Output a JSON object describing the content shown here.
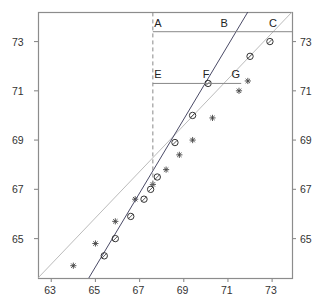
{
  "chart_data": {
    "type": "scatter",
    "title": "",
    "xlabel": "",
    "ylabel": "",
    "xlim": [
      62.4,
      73.9
    ],
    "ylim": [
      63.4,
      74.2
    ],
    "grid": false,
    "legend": null,
    "xticks": [
      63,
      65,
      67,
      69,
      71,
      73
    ],
    "yticks_left": [
      65,
      67,
      69,
      71,
      73
    ],
    "yticks_right": [
      65,
      67,
      69,
      71,
      73
    ],
    "xtick_labels": [
      "63",
      "65",
      "67",
      "69",
      "71",
      "73"
    ],
    "ytick_labels_left": [
      "65",
      "67",
      "69",
      "71",
      "73"
    ],
    "ytick_labels_right": [
      "65",
      "67",
      "69",
      "71",
      "73"
    ],
    "series": [
      {
        "name": "reference-line-stars",
        "marker": "star",
        "color": "#b3b3b3",
        "marker_color": "#444444",
        "line_from": [
          62.4,
          63.4
        ],
        "line_to": [
          73.9,
          74.2
        ],
        "points": [
          [
            64.0,
            63.9
          ],
          [
            65.0,
            64.8
          ],
          [
            65.9,
            65.7
          ],
          [
            66.8,
            66.6
          ],
          [
            67.6,
            67.2
          ],
          [
            68.2,
            67.8
          ],
          [
            68.8,
            68.4
          ],
          [
            69.4,
            69.0
          ],
          [
            70.3,
            69.9
          ],
          [
            71.5,
            71.0
          ],
          [
            71.9,
            71.4
          ]
        ]
      },
      {
        "name": "sample-line-circles",
        "marker": "circle",
        "color": "#4a4a66",
        "marker_color": "#333333",
        "line_from": [
          64.7,
          63.4
        ],
        "line_to": [
          71.9,
          74.2
        ],
        "points": [
          [
            65.4,
            64.3
          ],
          [
            65.9,
            65.0
          ],
          [
            66.6,
            65.9
          ],
          [
            67.2,
            66.6
          ],
          [
            67.5,
            67.0
          ],
          [
            67.8,
            67.5
          ],
          [
            68.6,
            68.9
          ],
          [
            69.4,
            70.0
          ],
          [
            70.1,
            71.3
          ],
          [
            72.0,
            72.4
          ],
          [
            72.9,
            73.0
          ]
        ]
      }
    ],
    "reference_lines": [
      {
        "name": "upper-horizontal-line",
        "orientation": "horizontal",
        "y": 73.4,
        "x_from": 67.6,
        "x_to": 73.9,
        "style": "solid",
        "labels": [
          {
            "text": "A",
            "x": 67.8,
            "y": 73.4
          },
          {
            "text": "B",
            "x": 70.8,
            "y": 73.4
          },
          {
            "text": "C",
            "x": 73.0,
            "y": 73.4
          }
        ]
      },
      {
        "name": "lower-horizontal-line",
        "orientation": "horizontal",
        "y": 71.3,
        "x_from": 67.6,
        "x_to": 71.6,
        "style": "solid",
        "labels": [
          {
            "text": "E",
            "x": 67.8,
            "y": 71.3
          },
          {
            "text": "F",
            "x": 70.0,
            "y": 71.3
          },
          {
            "text": "G",
            "x": 71.3,
            "y": 71.3
          }
        ]
      },
      {
        "name": "vertical-dashed-line",
        "orientation": "vertical",
        "x": 67.6,
        "y_from": 67.2,
        "y_to": 74.2,
        "style": "dashed",
        "labels": []
      }
    ],
    "annotations": [
      {
        "label": "A",
        "x": 67.8,
        "y": 73.4
      },
      {
        "label": "B",
        "x": 70.8,
        "y": 73.4
      },
      {
        "label": "C",
        "x": 73.0,
        "y": 73.4
      },
      {
        "label": "E",
        "x": 67.8,
        "y": 71.3
      },
      {
        "label": "F",
        "x": 70.0,
        "y": 71.3
      },
      {
        "label": "G",
        "x": 71.3,
        "y": 71.3
      }
    ],
    "colors": {
      "axis": "#8c8c8c",
      "reference_series": "#b3b3b3",
      "sample_series": "#4a4a66",
      "reference_line": "#888888",
      "text": "#2b2b2b",
      "background": "#ffffff"
    }
  }
}
